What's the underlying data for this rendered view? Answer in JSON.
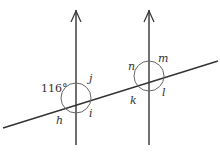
{
  "diagram": {
    "colors": {
      "line": "#333333",
      "arc": "#555555",
      "background": "#ffffff"
    },
    "parallel_lines": [
      {
        "id": "left",
        "x": 76,
        "y_top": 10,
        "y_bottom": 145,
        "arrow": "up"
      },
      {
        "id": "right",
        "x": 149,
        "y_top": 10,
        "y_bottom": 145,
        "arrow": "up"
      }
    ],
    "transversal": {
      "x1": 3,
      "y1": 128,
      "x2": 218,
      "y2": 61
    },
    "intersections": [
      {
        "id": "left",
        "labels": {
          "given_angle": "116°",
          "upper_right": "j",
          "lower_right": "i",
          "lower_left": "h"
        }
      },
      {
        "id": "right",
        "labels": {
          "upper_left": "n",
          "upper_right": "m",
          "lower_right": "l",
          "lower_left": "k"
        }
      }
    ]
  }
}
